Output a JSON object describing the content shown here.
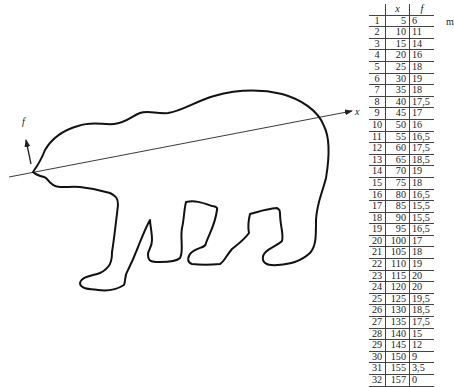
{
  "figure": {
    "axis_labels": {
      "x": "x",
      "f": "f"
    },
    "unit": "m",
    "outline_subject": "polar bear silhouette"
  },
  "table": {
    "headers": {
      "index": "",
      "x": "x",
      "f": "f"
    },
    "rows": [
      {
        "i": "1",
        "x": "5",
        "f": "6"
      },
      {
        "i": "2",
        "x": "10",
        "f": "11"
      },
      {
        "i": "3",
        "x": "15",
        "f": "14"
      },
      {
        "i": "4",
        "x": "20",
        "f": "16"
      },
      {
        "i": "5",
        "x": "25",
        "f": "18"
      },
      {
        "i": "6",
        "x": "30",
        "f": "19"
      },
      {
        "i": "7",
        "x": "35",
        "f": "18"
      },
      {
        "i": "8",
        "x": "40",
        "f": "17,5"
      },
      {
        "i": "9",
        "x": "45",
        "f": "17"
      },
      {
        "i": "10",
        "x": "50",
        "f": "16"
      },
      {
        "i": "11",
        "x": "55",
        "f": "16,5"
      },
      {
        "i": "12",
        "x": "60",
        "f": "17,5"
      },
      {
        "i": "13",
        "x": "65",
        "f": "18,5"
      },
      {
        "i": "14",
        "x": "70",
        "f": "19"
      },
      {
        "i": "15",
        "x": "75",
        "f": "18"
      },
      {
        "i": "16",
        "x": "80",
        "f": "16,5"
      },
      {
        "i": "17",
        "x": "85",
        "f": "15,5"
      },
      {
        "i": "18",
        "x": "90",
        "f": "15,5"
      },
      {
        "i": "19",
        "x": "95",
        "f": "16,5"
      },
      {
        "i": "20",
        "x": "100",
        "f": "17"
      },
      {
        "i": "21",
        "x": "105",
        "f": "18"
      },
      {
        "i": "22",
        "x": "110",
        "f": "19"
      },
      {
        "i": "23",
        "x": "115",
        "f": "20"
      },
      {
        "i": "24",
        "x": "120",
        "f": "20"
      },
      {
        "i": "25",
        "x": "125",
        "f": "19,5"
      },
      {
        "i": "26",
        "x": "130",
        "f": "18,5"
      },
      {
        "i": "27",
        "x": "135",
        "f": "17,5"
      },
      {
        "i": "28",
        "x": "140",
        "f": "15"
      },
      {
        "i": "29",
        "x": "145",
        "f": "12"
      },
      {
        "i": "30",
        "x": "150",
        "f": "9"
      },
      {
        "i": "31",
        "x": "155",
        "f": "3,5"
      },
      {
        "i": "32",
        "x": "157",
        "f": "0"
      }
    ]
  }
}
